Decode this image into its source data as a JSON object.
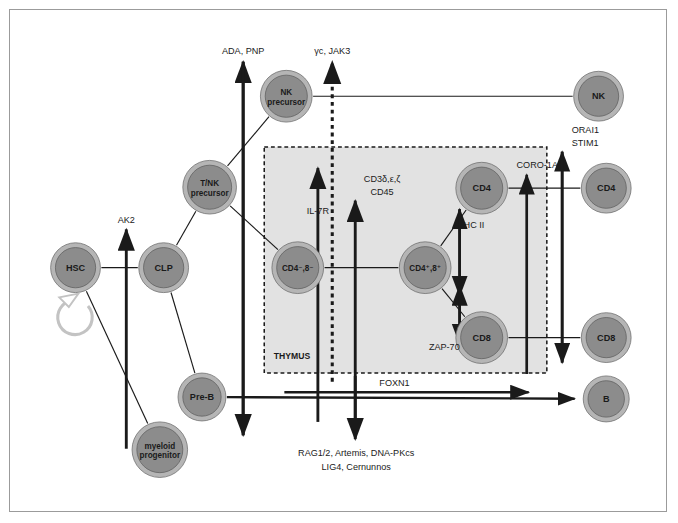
{
  "figure": {
    "compartment_label": "THYMUS",
    "background": "#ffffff",
    "frame_color": "#9b9b9b",
    "node_fill": "#8c8c8c",
    "node_ring": "#b5b5b5",
    "thymus_fill": "#e2e2e2",
    "line_color": "#1a1a1a",
    "text_color": "#1a1a1a"
  },
  "nodes": [
    {
      "id": "hsc",
      "label": "HSC",
      "label2": "",
      "cx": 65,
      "cy": 269,
      "r": 26
    },
    {
      "id": "clp",
      "label": "CLP",
      "label2": "",
      "cx": 157,
      "cy": 269,
      "r": 26
    },
    {
      "id": "tnk",
      "label": "T/NK",
      "label2": "precursor",
      "cx": 205,
      "cy": 185,
      "r": 28
    },
    {
      "id": "nkprec",
      "label": "NK",
      "label2": "precursor",
      "cx": 285,
      "cy": 90,
      "r": 27
    },
    {
      "id": "myeloid",
      "label": "myeloid",
      "label2": "progenitor",
      "cx": 153,
      "cy": 459,
      "r": 29
    },
    {
      "id": "preb",
      "label": "Pre-B",
      "label2": "",
      "cx": 197,
      "cy": 404,
      "r": 25
    },
    {
      "id": "cd4n8n",
      "label": "CD4⁻,8⁻",
      "label2": "",
      "cx": 297,
      "cy": 269,
      "r": 27
    },
    {
      "id": "cd4p8p",
      "label": "CD4⁺,8⁺",
      "label2": "",
      "cx": 430,
      "cy": 269,
      "r": 27
    },
    {
      "id": "cd4thy",
      "label": "CD4",
      "label2": "",
      "cx": 489,
      "cy": 186,
      "r": 27
    },
    {
      "id": "cd8thy",
      "label": "CD8",
      "label2": "",
      "cx": 489,
      "cy": 342,
      "r": 27
    },
    {
      "id": "nk",
      "label": "NK",
      "label2": "",
      "cx": 611,
      "cy": 90,
      "r": 26
    },
    {
      "id": "cd4per",
      "label": "CD4",
      "label2": "",
      "cx": 619,
      "cy": 186,
      "r": 26
    },
    {
      "id": "cd8per",
      "label": "CD8",
      "label2": "",
      "cx": 619,
      "cy": 342,
      "r": 26
    },
    {
      "id": "bcell",
      "label": "B",
      "label2": "",
      "cx": 619,
      "cy": 406,
      "r": 24
    }
  ],
  "gene_labels": [
    {
      "id": "ada-pnp",
      "text": "ADA, PNP",
      "x": 240,
      "y": 46,
      "anchor": "middle"
    },
    {
      "id": "gc-jak3",
      "text": "γc, JAK3",
      "x": 333,
      "y": 46,
      "anchor": "middle"
    },
    {
      "id": "ak2",
      "text": "AK2",
      "x": 118,
      "y": 222,
      "anchor": "middle"
    },
    {
      "id": "il7r",
      "text": "IL-7R",
      "x": 318,
      "y": 213,
      "anchor": "middle"
    },
    {
      "id": "cd3",
      "text": "CD3δ,ε,ζ",
      "x": 385,
      "y": 180,
      "anchor": "middle"
    },
    {
      "id": "cd45",
      "text": "CD45",
      "x": 385,
      "y": 193,
      "anchor": "middle"
    },
    {
      "id": "mhc2",
      "text": "MHC II",
      "x": 477,
      "y": 228,
      "anchor": "middle"
    },
    {
      "id": "zap70",
      "text": "ZAP-70",
      "x": 450,
      "y": 355,
      "anchor": "middle"
    },
    {
      "id": "coro1a",
      "text": "CORO-1A",
      "x": 547,
      "y": 165,
      "anchor": "middle"
    },
    {
      "id": "orai1",
      "text": "ORAI1",
      "x": 583,
      "y": 128,
      "anchor": "start"
    },
    {
      "id": "stim1",
      "text": "STIM1",
      "x": 583,
      "y": 142,
      "anchor": "start"
    },
    {
      "id": "foxn1",
      "text": "FOXN1",
      "x": 398,
      "y": 392,
      "anchor": "middle"
    },
    {
      "id": "rag",
      "text": "RAG1/2, Artemis, DNA-PKcs",
      "x": 358,
      "y": 466,
      "anchor": "middle"
    },
    {
      "id": "lig4",
      "text": "LIG4, Cernunnos",
      "x": 358,
      "y": 480,
      "anchor": "middle"
    },
    {
      "id": "thymus",
      "text": "THYMUS",
      "x": 272,
      "y": 364,
      "anchor": "start"
    }
  ],
  "thymus_box": {
    "x": 262,
    "y": 143,
    "width": 295,
    "height": 236
  },
  "connections": [
    {
      "from": "hsc",
      "to": "clp",
      "kind": "line"
    },
    {
      "from": "clp",
      "to": "tnk",
      "kind": "line"
    },
    {
      "from": "clp",
      "to": "preb",
      "kind": "line"
    },
    {
      "from": "hsc",
      "to": "myeloid",
      "kind": "line"
    },
    {
      "from": "tnk",
      "to": "nkprec",
      "kind": "line"
    },
    {
      "from": "tnk",
      "to": "cd4n8n",
      "kind": "line"
    },
    {
      "from": "cd4n8n",
      "to": "cd4p8p",
      "kind": "line"
    },
    {
      "from": "cd4p8p",
      "to": "cd4thy",
      "kind": "line"
    },
    {
      "from": "cd4p8p",
      "to": "cd8thy",
      "kind": "line"
    },
    {
      "from": "nkprec",
      "to": "nk",
      "kind": "line"
    },
    {
      "from": "cd4thy",
      "to": "cd4per",
      "kind": "line"
    },
    {
      "from": "cd8thy",
      "to": "cd8per",
      "kind": "line"
    },
    {
      "from": "preb",
      "to": "bcell",
      "kind": "arrow"
    }
  ]
}
